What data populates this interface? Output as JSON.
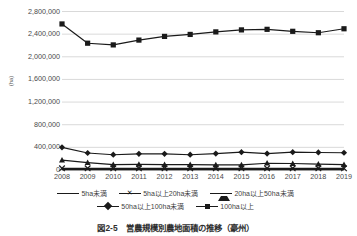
{
  "caption": "図2-5　営農規模別農地面積の推移（豪州）",
  "axis": {
    "ylabel": "(ha)",
    "yticks": [
      "0",
      "400,000",
      "800,000",
      "1,200,000",
      "1,600,000",
      "2,000,000",
      "2,400,000",
      "2,800,000"
    ],
    "xticks": [
      "2008",
      "2009",
      "2010",
      "2011",
      "2012",
      "2013",
      "2014",
      "2015",
      "2016",
      "2017",
      "2018",
      "2019"
    ]
  },
  "legend": {
    "items": [
      {
        "label": "5ha未満",
        "marker": "none"
      },
      {
        "label": "5ha以上20ha未満",
        "marker": "cross"
      },
      {
        "label": "20ha以上50ha未満",
        "marker": "triangle"
      },
      {
        "label": "50ha以上100ha未満",
        "marker": "diamond"
      },
      {
        "label": "100ha以上",
        "marker": "square"
      }
    ]
  },
  "chart_data": {
    "type": "line",
    "title": "図2-5　営農規模別農地面積の推移（豪州）",
    "xlabel": "",
    "ylabel": "(ha)",
    "ylim": [
      0,
      2800000
    ],
    "ytick_step": 400000,
    "grid": true,
    "legend_position": "bottom",
    "x": [
      2008,
      2009,
      2010,
      2011,
      2012,
      2013,
      2014,
      2015,
      2016,
      2017,
      2018,
      2019
    ],
    "series": [
      {
        "name": "5ha未満",
        "marker": "none",
        "color": "#1a1a1a",
        "values": [
          6000,
          6000,
          6000,
          6000,
          6000,
          6000,
          6000,
          6000,
          6000,
          6000,
          6000,
          6000
        ]
      },
      {
        "name": "5ha以上20ha未満",
        "marker": "cross",
        "color": "#1a1a1a",
        "values": [
          30000,
          30000,
          30000,
          30000,
          30000,
          30000,
          30000,
          30000,
          30000,
          30000,
          30000,
          30000
        ]
      },
      {
        "name": "20ha以上50ha未満",
        "marker": "triangle",
        "color": "#1a1a1a",
        "values": [
          175000,
          130000,
          95000,
          100000,
          95000,
          95000,
          90000,
          90000,
          120000,
          115000,
          105000,
          95000
        ]
      },
      {
        "name": "50ha以上100ha未満",
        "marker": "diamond",
        "color": "#1a1a1a",
        "values": [
          400000,
          300000,
          270000,
          285000,
          285000,
          270000,
          290000,
          315000,
          290000,
          315000,
          310000,
          305000
        ]
      },
      {
        "name": "100ha以上",
        "marker": "square",
        "color": "#1a1a1a",
        "values": [
          2580000,
          2240000,
          2210000,
          2295000,
          2360000,
          2395000,
          2440000,
          2475000,
          2485000,
          2450000,
          2425000,
          2495000
        ]
      }
    ]
  }
}
